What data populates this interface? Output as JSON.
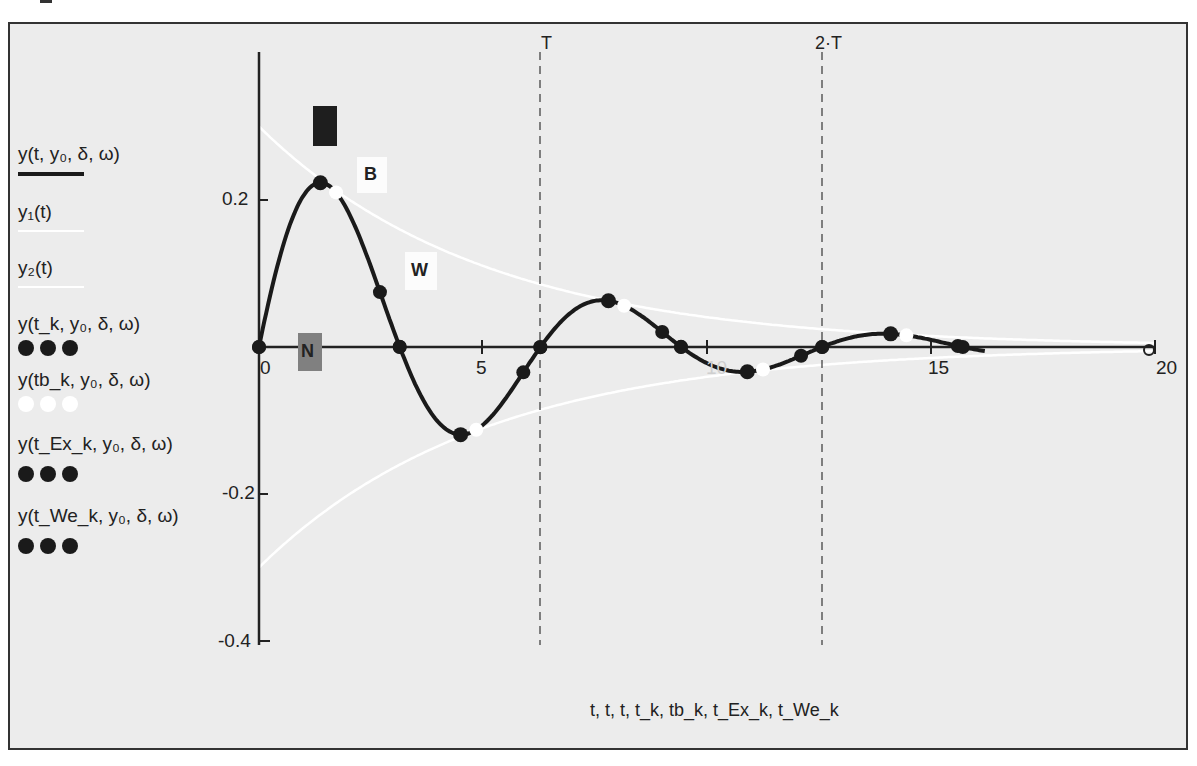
{
  "chart_data": {
    "type": "line",
    "title": "",
    "xlabel": "t, t, t, t_k, tb_k, t_Ex_k, t_We_k",
    "ylabel": "",
    "xlim": [
      0,
      20
    ],
    "ylim": [
      -0.4,
      0.3
    ],
    "x_ticks": [
      "0",
      "5",
      "10",
      "15",
      "20"
    ],
    "y_ticks": [
      "0.2",
      "-0.2",
      "-0.4"
    ],
    "grid": false,
    "legend_position": "left",
    "params": {
      "y0": 0.3,
      "delta": 0.2,
      "omega": 1.0
    },
    "markers": [
      {
        "label": "T",
        "x": 6.28
      },
      {
        "label": "2·T",
        "x": 12.57
      }
    ],
    "series": [
      {
        "name": "y(t, y0, δ, ω)",
        "style": "solid black thick",
        "formula": "0.3·e^(-0.2t)·sin(t)"
      },
      {
        "name": "y1(t)",
        "style": "white line",
        "formula": "0.3·e^(-0.2t)"
      },
      {
        "name": "y2(t)",
        "style": "white line",
        "formula": "-0.3·e^(-0.2t)"
      },
      {
        "name": "y(t_k, y0, δ, ω)",
        "style": "black dots",
        "points": [
          [
            0,
            0
          ],
          [
            2.7,
            0.068
          ],
          [
            3.14,
            0
          ],
          [
            5.9,
            -0.035
          ],
          [
            6.28,
            0
          ],
          [
            9.0,
            0.015
          ],
          [
            9.42,
            0
          ],
          [
            12.1,
            -0.006
          ],
          [
            12.57,
            0
          ],
          [
            15.6,
            0.0
          ]
        ]
      },
      {
        "name": "y(tb_k, y0, δ, ω)",
        "style": "white dots",
        "points": [
          [
            1.37,
            0.224
          ],
          [
            4.5,
            -0.12
          ],
          [
            7.8,
            0.063
          ],
          [
            10.9,
            -0.032
          ],
          [
            14.1,
            0.017
          ]
        ]
      },
      {
        "name": "y(t_Ex_k, y0, δ, ω)",
        "style": "black dots",
        "points": [
          [
            1.37,
            0.224
          ],
          [
            4.5,
            -0.12
          ],
          [
            7.8,
            0.063
          ],
          [
            10.9,
            -0.032
          ],
          [
            14.1,
            0.017
          ]
        ]
      },
      {
        "name": "y(t_We_k, y0, δ, ω)",
        "style": "black dots",
        "points": [
          [
            0,
            0
          ],
          [
            3.14,
            0
          ],
          [
            6.28,
            0
          ],
          [
            9.42,
            0
          ],
          [
            12.57,
            0
          ],
          [
            15.71,
            0
          ]
        ]
      }
    ],
    "annotations": [
      {
        "text": "B",
        "x": 2.6,
        "y": 0.23
      },
      {
        "text": "W",
        "x": 3.7,
        "y": 0.105
      },
      {
        "text": "N",
        "x": 1.1,
        "y": 0.0
      }
    ]
  },
  "legend": {
    "items": [
      {
        "label": "y(t, y₀, δ, ω)"
      },
      {
        "label": "y₁(t)"
      },
      {
        "label": "y₂(t)"
      },
      {
        "label": "y(t_k, y₀, δ, ω)"
      },
      {
        "label": "y(tb_k, y₀, δ, ω)"
      },
      {
        "label": "y(t_Ex_k, y₀, δ, ω)"
      },
      {
        "label": "y(t_We_k, y₀, δ, ω)"
      }
    ]
  },
  "axes": {
    "x_ticks": [
      "0",
      "5",
      "10",
      "15",
      "20"
    ],
    "y_ticks": {
      "p02": "0.2",
      "m02": "-0.2",
      "m04": "-0.4"
    },
    "xlabel": "t, t, t, t_k, tb_k, t_Ex_k, t_We_k"
  },
  "markers": {
    "T": "T",
    "T2": "2·T"
  },
  "annotations": {
    "B": "B",
    "W": "W",
    "N": "N"
  },
  "colors": {
    "curve": "#1a1a1a",
    "envelope": "#ffffff",
    "background": "#ececec",
    "frame": "#333333",
    "marker_N": "#7a7a7a"
  }
}
